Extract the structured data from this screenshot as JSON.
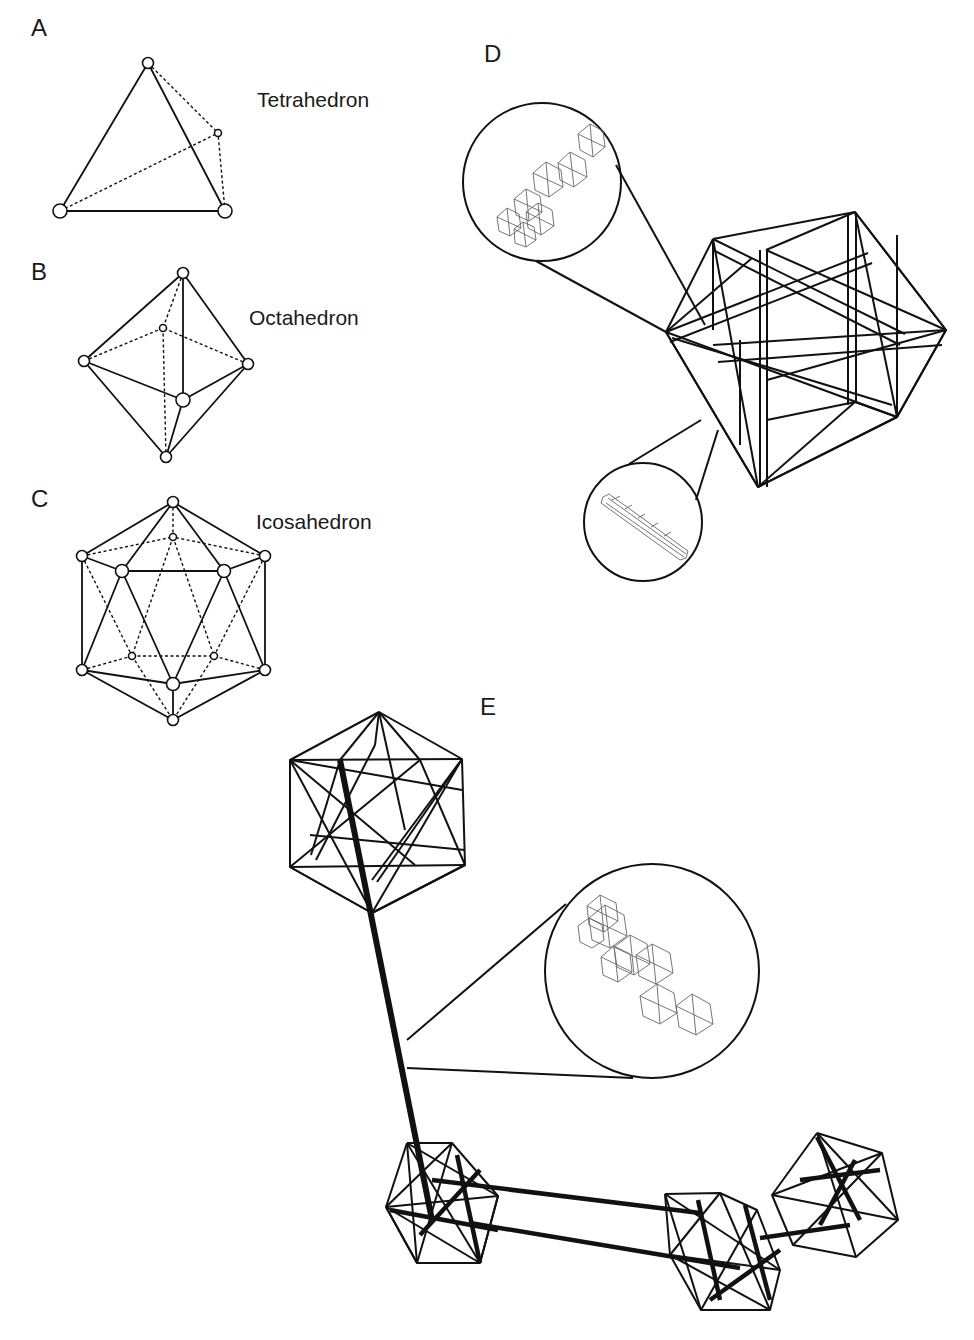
{
  "figure": {
    "panels": [
      {
        "id": "A",
        "label": "A",
        "title": "Tetrahedron"
      },
      {
        "id": "B",
        "label": "B",
        "title": "Octahedron"
      },
      {
        "id": "C",
        "label": "C",
        "title": "Icosahedron"
      },
      {
        "id": "D",
        "label": "D",
        "title": ""
      },
      {
        "id": "E",
        "label": "E",
        "title": ""
      }
    ]
  },
  "colors": {
    "line": "#111111",
    "background": "#ffffff",
    "inset_wire": "#666666"
  }
}
